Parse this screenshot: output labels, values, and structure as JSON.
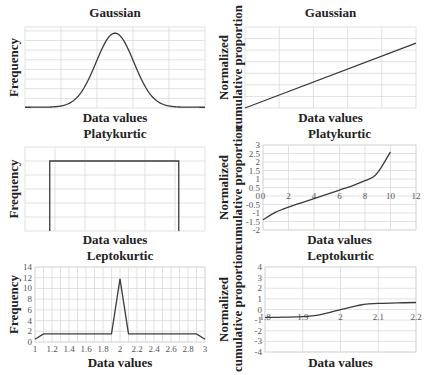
{
  "chart_data": [
    {
      "id": "gaussian-frequency",
      "type": "line",
      "title": "Gaussian",
      "xlabel": "Data values",
      "ylabel": [
        "Frequency"
      ],
      "xlim": [
        0,
        10
      ],
      "ylim": [
        0,
        1.05
      ],
      "x_gridlines": [
        2,
        4,
        6,
        8
      ],
      "y_gridlines": [
        0.125,
        0.25,
        0.375,
        0.5,
        0.625,
        0.75,
        0.875,
        1.0
      ],
      "show_tick_labels": false,
      "function": "gaussian",
      "mean": 5,
      "sd": 1.05,
      "grid": true
    },
    {
      "id": "gaussian-cumulative",
      "type": "line",
      "title": "Gaussian",
      "xlabel": "Data values",
      "ylabel": [
        "Normalized",
        "cumulative proportion"
      ],
      "xlim": [
        0,
        10
      ],
      "ylim": [
        0,
        7
      ],
      "x_gridlines": [
        2,
        4,
        6,
        8
      ],
      "y_gridlines": [
        1,
        2,
        3,
        4,
        5,
        6
      ],
      "show_tick_labels": false,
      "x": [
        0,
        10
      ],
      "y": [
        0,
        5.6
      ],
      "grid": true
    },
    {
      "id": "platykurtic-frequency",
      "type": "line",
      "title": "Platykurtic",
      "xlabel": "Data values",
      "ylabel": [
        "Frequency"
      ],
      "xlim": [
        0,
        12
      ],
      "ylim": [
        0,
        6
      ],
      "x_gridlines": [
        2,
        4,
        6,
        8,
        10
      ],
      "y_gridlines": [
        1,
        2,
        3,
        4,
        5
      ],
      "show_tick_labels": false,
      "x": [
        1.65,
        1.65,
        10.25,
        10.25
      ],
      "y": [
        0,
        5,
        5,
        0
      ],
      "grid": true
    },
    {
      "id": "platykurtic-cumulative",
      "type": "line",
      "title": "Platykurtic",
      "xlabel": "Data values",
      "ylabel": [
        "Normalized",
        "cumulative proportion"
      ],
      "xlim": [
        0,
        12
      ],
      "ylim": [
        -2,
        3
      ],
      "xticks": [
        0,
        2,
        4,
        6,
        8,
        10,
        12
      ],
      "xtick_labels": [
        "0",
        "2",
        "4",
        "6",
        "8",
        "10",
        "12"
      ],
      "yticks": [
        -2,
        -1.5,
        -1,
        -0.5,
        0,
        0.5,
        1,
        1.5,
        2,
        2.5,
        3
      ],
      "ytick_labels": [
        "-2",
        "-1.5",
        "-1",
        "-0.5",
        "0",
        "0.5",
        "1",
        "1.5",
        "2",
        "2.5",
        "3"
      ],
      "x_axis_at_y": 0,
      "x": [
        0,
        1,
        2,
        3,
        4,
        5,
        6,
        7,
        8,
        8.7,
        9.2,
        10
      ],
      "y": [
        -1.4,
        -0.95,
        -0.65,
        -0.4,
        -0.15,
        0.1,
        0.35,
        0.6,
        0.9,
        1.15,
        1.6,
        2.6
      ],
      "grid": true
    },
    {
      "id": "leptokurtic-frequency",
      "type": "line",
      "title": "Leptokurtic",
      "xlabel": "Data values",
      "ylabel": [
        "Frequency"
      ],
      "xlim": [
        1,
        3
      ],
      "ylim": [
        0,
        14
      ],
      "xticks": [
        1,
        1.2,
        1.4,
        1.6,
        1.8,
        2,
        2.2,
        2.4,
        2.6,
        2.8,
        3
      ],
      "xtick_labels": [
        "1",
        "1.2",
        "1.4",
        "1.6",
        "1.8",
        "2",
        "2.2",
        "2.4",
        "2.6",
        "2.8",
        "3"
      ],
      "yticks": [
        0,
        2,
        4,
        6,
        8,
        10,
        12,
        14
      ],
      "ytick_labels": [
        "0",
        "2",
        "4",
        "6",
        "8",
        "10",
        "12",
        "14"
      ],
      "x_minor_gridlines": [
        1.1,
        1.3,
        1.5,
        1.7,
        1.9,
        2.1,
        2.3,
        2.5,
        2.7,
        2.9
      ],
      "x": [
        1,
        1.1,
        1.9,
        2,
        2.1,
        2.9,
        3
      ],
      "y": [
        0.5,
        1.5,
        1.5,
        11.8,
        1.5,
        1.5,
        0.5
      ],
      "grid": true
    },
    {
      "id": "leptokurtic-cumulative",
      "type": "line",
      "title": "Leptokurtic",
      "xlabel": "Data values",
      "ylabel": [
        "Normalized",
        "cumulative proportion"
      ],
      "xlim": [
        1.8,
        2.2
      ],
      "ylim": [
        -4,
        4
      ],
      "xticks": [
        1.8,
        1.9,
        2,
        2.1,
        2.2
      ],
      "xtick_labels": [
        "1.8",
        "1.9",
        "2",
        "2.1",
        "2.2"
      ],
      "yticks": [
        -4,
        -3,
        -2,
        -1,
        0,
        1,
        2,
        3,
        4
      ],
      "ytick_labels": [
        "-4",
        "-3",
        "-2",
        "-1",
        "0",
        "1",
        "2",
        "3",
        "4"
      ],
      "x_axis_at_y": -0.7,
      "x": [
        1.8,
        1.85,
        1.9,
        1.925,
        1.95,
        1.975,
        2.0,
        2.025,
        2.05,
        2.075,
        2.1,
        2.15,
        2.2
      ],
      "y": [
        -0.75,
        -0.72,
        -0.68,
        -0.6,
        -0.45,
        -0.25,
        -0.02,
        0.2,
        0.4,
        0.52,
        0.58,
        0.62,
        0.66
      ],
      "grid": true
    }
  ]
}
